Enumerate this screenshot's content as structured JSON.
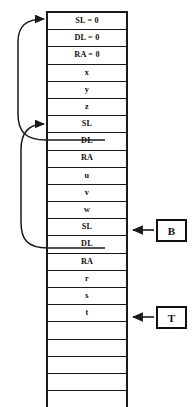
{
  "diagram": {
    "stack": {
      "name": "activation-record-stack",
      "rows": [
        {
          "label": "SL = 0",
          "kind": "static-link"
        },
        {
          "label": "DL = 0",
          "kind": "dynamic-link"
        },
        {
          "label": "RA = 0",
          "kind": "return-address"
        },
        {
          "label": "x",
          "kind": "local"
        },
        {
          "label": "y",
          "kind": "local"
        },
        {
          "label": "z",
          "kind": "local"
        },
        {
          "label": "SL",
          "kind": "static-link"
        },
        {
          "label": "DL",
          "kind": "dynamic-link"
        },
        {
          "label": "RA",
          "kind": "return-address"
        },
        {
          "label": "u",
          "kind": "local"
        },
        {
          "label": "v",
          "kind": "local"
        },
        {
          "label": "w",
          "kind": "local"
        },
        {
          "label": "SL",
          "kind": "static-link"
        },
        {
          "label": "DL",
          "kind": "dynamic-link"
        },
        {
          "label": "RA",
          "kind": "return-address"
        },
        {
          "label": "r",
          "kind": "local"
        },
        {
          "label": "s",
          "kind": "local"
        },
        {
          "label": "t",
          "kind": "local"
        },
        {
          "label": "",
          "kind": "empty"
        },
        {
          "label": "",
          "kind": "empty"
        },
        {
          "label": "",
          "kind": "empty"
        },
        {
          "label": "",
          "kind": "empty"
        },
        {
          "label": "",
          "kind": "empty"
        }
      ]
    },
    "pointers": [
      {
        "id": "base-pointer",
        "label": "B",
        "points_to_row": 12
      },
      {
        "id": "top-pointer",
        "label": "T",
        "points_to_row": 17
      }
    ],
    "links": [
      {
        "id": "dynamic-link-1",
        "from_row": 7,
        "to_row": 0
      },
      {
        "id": "dynamic-link-2",
        "from_row": 13,
        "to_row": 6
      }
    ],
    "colors": {
      "line": "#1a1a1a",
      "text": "#111111",
      "background": "#ffffff"
    }
  }
}
